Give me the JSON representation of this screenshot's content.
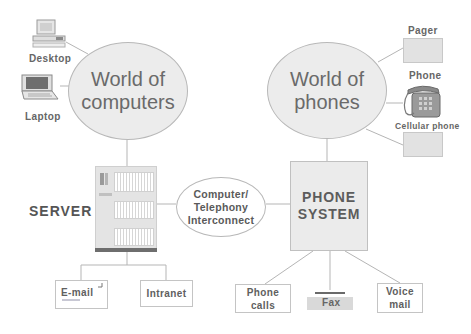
{
  "diagram": {
    "computers_world": {
      "line1": "World of",
      "line2": "computers"
    },
    "phones_world": {
      "line1": "World of",
      "line2": "phones"
    },
    "computer_devices": [
      {
        "label": "Desktop",
        "icon": "desktop-computer-icon"
      },
      {
        "label": "Laptop",
        "icon": "laptop-icon"
      }
    ],
    "phone_devices": [
      {
        "label": "Pager",
        "icon": "pager-icon"
      },
      {
        "label": "Phone",
        "icon": "desk-phone-icon"
      },
      {
        "label": "Cellular phone",
        "icon": "cellular-phone-icon"
      }
    ],
    "server": {
      "label": "SERVER",
      "icon": "server-rack-icon"
    },
    "interconnect": {
      "line1": "Computer/",
      "line2": "Telephony",
      "line3": "Interconnect"
    },
    "phone_system": {
      "line1": "PHONE",
      "line2": "SYSTEM"
    },
    "server_services": [
      {
        "label": "E-mail"
      },
      {
        "label": "Intranet"
      }
    ],
    "phone_services": [
      {
        "line1": "Phone",
        "line2": "calls"
      },
      {
        "label": "Fax",
        "icon": "fax-machine-icon"
      },
      {
        "line1": "Voice",
        "line2": "mail"
      }
    ],
    "colors": {
      "line": "#b5b5b5",
      "ellipse_fill": "#ececec",
      "text": "#5a5a5a"
    }
  }
}
